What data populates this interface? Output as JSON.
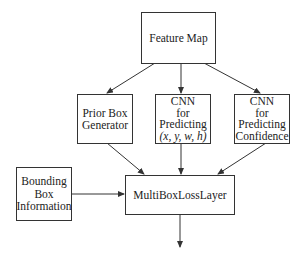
{
  "diagram": {
    "nodes": {
      "feature_map": {
        "label": "Feature Map"
      },
      "prior_box": {
        "lines": [
          "Prior Box",
          "Generator"
        ]
      },
      "cnn_xywh": {
        "lines": [
          "CNN",
          "for",
          "Predicting",
          "(x, y, w, h)"
        ]
      },
      "cnn_conf": {
        "lines": [
          "CNN",
          "for",
          "Predicting",
          "Confidence"
        ]
      },
      "bbox_info": {
        "lines": [
          "Bounding",
          "Box",
          "Information"
        ]
      },
      "loss_layer": {
        "label": "MultiBoxLossLayer"
      }
    },
    "edges": [
      {
        "from": "Feature Map",
        "to": "Prior Box Generator"
      },
      {
        "from": "Feature Map",
        "to": "CNN for Predicting (x, y, w, h)"
      },
      {
        "from": "Feature Map",
        "to": "CNN for Predicting Confidence"
      },
      {
        "from": "Prior Box Generator",
        "to": "MultiBoxLossLayer"
      },
      {
        "from": "CNN for Predicting (x, y, w, h)",
        "to": "MultiBoxLossLayer"
      },
      {
        "from": "CNN for Predicting Confidence",
        "to": "MultiBoxLossLayer"
      },
      {
        "from": "Bounding Box Information",
        "to": "MultiBoxLossLayer"
      },
      {
        "from": "MultiBoxLossLayer",
        "to": "output"
      }
    ]
  }
}
